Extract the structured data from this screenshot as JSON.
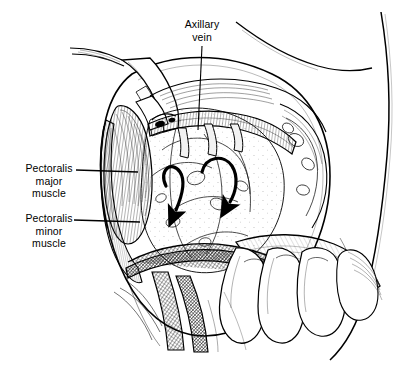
{
  "figure": {
    "kind": "anatomical-line-illustration",
    "background_color": "#ffffff",
    "ink_color": "#000000"
  },
  "labels": {
    "axillary_vein": "Axillary\nvein",
    "pectoralis_major": "Pectoralis\nmajor\nmuscle",
    "pectoralis_minor": "Pectoralis\nminor\nmuscle"
  },
  "annotations": {
    "arrow_left": "curved-arrow-down-left",
    "arrow_right": "curved-arrow-down-right",
    "leader_axillary_vein": "vertical-leader-line",
    "leader_pectoralis_major": "horizontal-leader-line",
    "leader_pectoralis_minor": "horizontal-leader-line"
  }
}
